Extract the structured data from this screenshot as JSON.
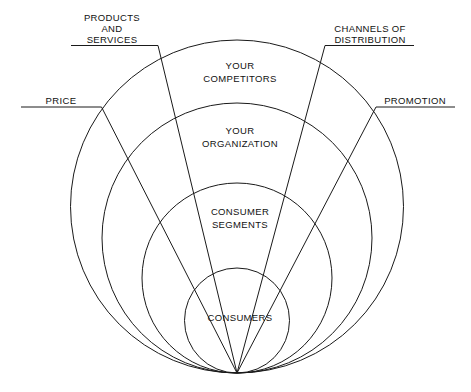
{
  "diagram": {
    "background_color": "#ffffff",
    "line_color": "#1a1a1a",
    "text_color": "#111111",
    "rings": [
      {
        "id": "competitors",
        "label_lines": [
          "YOUR",
          "COMPETITORS"
        ],
        "line1": "YOUR",
        "line2": "COMPETITORS",
        "level": 1
      },
      {
        "id": "organization",
        "label_lines": [
          "YOUR",
          "ORGANIZATION"
        ],
        "line1": "YOUR",
        "line2": "ORGANIZATION",
        "level": 2
      },
      {
        "id": "consumer-segments",
        "label_lines": [
          "CONSUMER",
          "SEGMENTS"
        ],
        "line1": "CONSUMER",
        "line2": "SEGMENTS",
        "level": 3
      },
      {
        "id": "consumers",
        "label_lines": [
          "CONSUMERS"
        ],
        "line1": "CONSUMERS",
        "line2": "",
        "level": 4
      }
    ],
    "callouts": [
      {
        "id": "products-and-services",
        "line1": "PRODUCTS",
        "line2": "AND",
        "line3": "SERVICES",
        "position": "top-left"
      },
      {
        "id": "channels-of-distribution",
        "line1": "CHANNELS OF",
        "line2": "DISTRIBUTION",
        "line3": "",
        "position": "top-right"
      },
      {
        "id": "price",
        "line1": "PRICE",
        "line2": "",
        "line3": "",
        "position": "mid-left"
      },
      {
        "id": "promotion",
        "line1": "PROMOTION",
        "line2": "",
        "line3": "",
        "position": "mid-right"
      }
    ]
  }
}
